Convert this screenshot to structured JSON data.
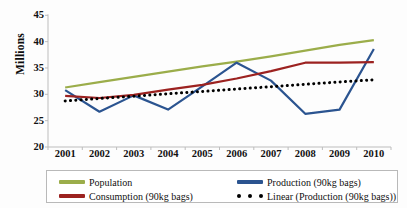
{
  "chart_data": {
    "type": "line",
    "title": "",
    "xlabel": "",
    "ylabel": "Millions",
    "categories": [
      "2001",
      "2002",
      "2003",
      "2004",
      "2005",
      "2006",
      "2007",
      "2008",
      "2009",
      "2010"
    ],
    "ylim": [
      20,
      45
    ],
    "yticks": [
      20,
      25,
      30,
      35,
      40,
      45
    ],
    "grid": false,
    "legend_position": "bottom",
    "series": [
      {
        "name": "Population",
        "color": "#9bad4a",
        "style": "solid",
        "values": [
          31.3,
          32.3,
          33.3,
          34.3,
          35.3,
          36.2,
          37.2,
          38.3,
          39.4,
          40.3
        ]
      },
      {
        "name": "Production (90kg bags)",
        "color": "#2b5490",
        "style": "solid",
        "values": [
          30.8,
          26.7,
          29.8,
          27.1,
          31.5,
          36.0,
          32.6,
          26.3,
          27.1,
          38.6
        ]
      },
      {
        "name": "Consumption (90kg bags)",
        "color": "#9c2220",
        "style": "solid",
        "values": [
          29.7,
          29.3,
          29.9,
          30.9,
          31.8,
          33.0,
          34.4,
          36.0,
          36.0,
          36.1
        ]
      },
      {
        "name": "Linear (Production (90kg bags))",
        "color": "#000000",
        "style": "dotted",
        "values": [
          28.75,
          29.2,
          29.65,
          30.1,
          30.55,
          31.0,
          31.45,
          31.9,
          32.35,
          32.75
        ]
      }
    ]
  },
  "legend": {
    "items": [
      {
        "label": "Population",
        "marker": "line-swatch",
        "color": "#9bad4a"
      },
      {
        "label": "Production (90kg bags)",
        "marker": "line-swatch",
        "color": "#2b5490"
      },
      {
        "label": "Consumption (90kg bags)",
        "marker": "line-swatch",
        "color": "#9c2220"
      },
      {
        "label": "Linear (Production (90kg bags))",
        "marker": "dotted-swatch",
        "color": "#000000"
      }
    ]
  }
}
